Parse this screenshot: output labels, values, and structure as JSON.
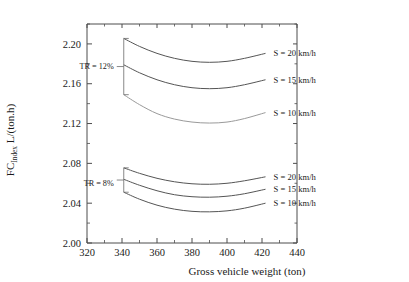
{
  "chart_data": {
    "type": "line",
    "title": "",
    "xlabel": "Gross vehicle weight (ton)",
    "ylabel": "FC_Index  L/(ton.h)",
    "ylabel_main": "FC",
    "ylabel_sub": "Index",
    "ylabel_unit": "L/(ton.h)",
    "xlim": [
      320,
      440
    ],
    "ylim": [
      2.0,
      2.22
    ],
    "xticks": [
      320,
      340,
      360,
      380,
      400,
      420,
      440
    ],
    "xtick_labels": [
      "320",
      "340",
      "360",
      "380",
      "400",
      "420",
      "440"
    ],
    "yticks": [
      2.0,
      2.04,
      2.08,
      2.12,
      2.16,
      2.2
    ],
    "ytick_labels": [
      "2.00",
      "2.04",
      "2.08",
      "2.12",
      "2.16",
      "2.20"
    ],
    "x_minor_step": 10,
    "y_minor_step": 0.02,
    "grid": false,
    "legend_position": "right-inline",
    "annotations": [
      {
        "name": "group-tr-12",
        "text": "TR = 12%",
        "x": 341,
        "y": 2.178
      },
      {
        "name": "group-tr-8",
        "text": "TR = 8%",
        "x": 341,
        "y": 2.06
      }
    ],
    "groups": [
      {
        "name": "TR = 12%",
        "tr": 12,
        "series": [
          {
            "name": "S = 20 km/h",
            "label": "S = 20 km/h",
            "x": [
              341,
              350,
              360,
              370,
              380,
              390,
              400,
              410,
              422
            ],
            "y": [
              2.2055,
              2.1975,
              2.1905,
              2.1855,
              2.1825,
              2.1815,
              2.1825,
              2.1855,
              2.1905
            ]
          },
          {
            "name": "S = 15 km/h",
            "label": "S = 15 km/h",
            "x": [
              341,
              350,
              360,
              370,
              380,
              390,
              400,
              410,
              422
            ],
            "y": [
              2.179,
              2.171,
              2.164,
              2.159,
              2.156,
              2.155,
              2.156,
              2.159,
              2.164
            ]
          },
          {
            "name": "S = 10 km/h",
            "label": "S = 10 km/h",
            "x": [
              341,
              350,
              360,
              370,
              380,
              390,
              400,
              410,
              422
            ],
            "y": [
              2.149,
              2.139,
              2.13,
              2.1245,
              2.1215,
              2.1205,
              2.1215,
              2.125,
              2.131
            ]
          }
        ]
      },
      {
        "name": "TR = 8%",
        "tr": 8,
        "series": [
          {
            "name": "S = 20 km/h",
            "label": "S = 20 km/h",
            "x": [
              341,
              350,
              360,
              370,
              380,
              390,
              400,
              410,
              422
            ],
            "y": [
              2.0755,
              2.07,
              2.065,
              2.0615,
              2.0595,
              2.059,
              2.06,
              2.0625,
              2.0665
            ]
          },
          {
            "name": "S = 15 km/h",
            "label": "S = 15 km/h",
            "x": [
              341,
              350,
              360,
              370,
              380,
              390,
              400,
              410,
              422
            ],
            "y": [
              2.064,
              2.058,
              2.0525,
              2.0485,
              2.0465,
              2.046,
              2.047,
              2.0495,
              2.054
            ]
          },
          {
            "name": "S = 10 km/h",
            "label": "S = 10 km/h",
            "x": [
              341,
              350,
              360,
              370,
              380,
              390,
              400,
              410,
              422
            ],
            "y": [
              2.051,
              2.044,
              2.038,
              2.034,
              2.0318,
              2.0313,
              2.0323,
              2.035,
              2.04
            ]
          }
        ]
      }
    ],
    "colors": {
      "axis": "#4d4d4d",
      "curve_dark": "#555555",
      "curve_light": "#9a9a9a",
      "text": "#1a1a1a",
      "background": "#ffffff"
    }
  }
}
